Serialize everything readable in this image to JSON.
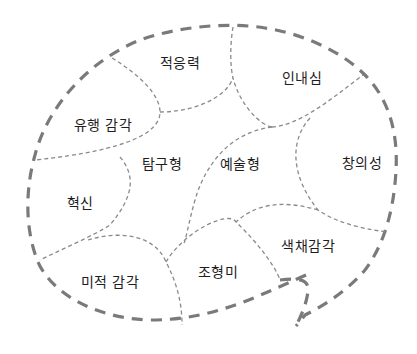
{
  "diagram": {
    "type": "speech-bubble region map",
    "style": {
      "outer_border_color": "#7a7a7a",
      "inner_border_color": "#8a8a8a",
      "text_color": "#1e1e1e",
      "background": "#ffffff"
    },
    "regions": [
      {
        "id": "adaptability",
        "label": "적응력",
        "x": 180,
        "y": 62
      },
      {
        "id": "patience",
        "label": "인내심",
        "x": 302,
        "y": 77
      },
      {
        "id": "trend-sense",
        "label": "유행 감각",
        "x": 103,
        "y": 124
      },
      {
        "id": "exploratory",
        "label": "탐구형",
        "x": 162,
        "y": 163
      },
      {
        "id": "artistic",
        "label": "예술형",
        "x": 240,
        "y": 163
      },
      {
        "id": "creativity",
        "label": "창의성",
        "x": 362,
        "y": 162
      },
      {
        "id": "innovation",
        "label": "혁신",
        "x": 80,
        "y": 202
      },
      {
        "id": "color-sense",
        "label": "색채감각",
        "x": 308,
        "y": 245
      },
      {
        "id": "formative-beauty",
        "label": "조형미",
        "x": 218,
        "y": 271
      },
      {
        "id": "aesthetic-sense",
        "label": "미적 감각",
        "x": 110,
        "y": 281
      }
    ]
  }
}
